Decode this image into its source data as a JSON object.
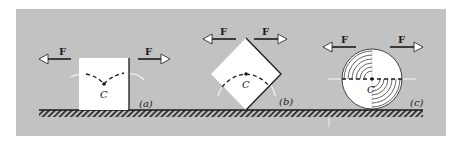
{
  "diagram": {
    "colors": {
      "panel": "#c2c2c2",
      "body": "#ffffff",
      "ink": "#1a1a1a",
      "faint_path": "#f2f2f2"
    },
    "panels": [
      {
        "id": "a",
        "label": "(a)",
        "shape": "square",
        "center_label": "C",
        "force_left_label": "F",
        "force_right_label": "F"
      },
      {
        "id": "b",
        "label": "(b)",
        "shape": "square on edge (rotated 45°)",
        "center_label": "C",
        "force_left_label": "F",
        "force_right_label": "F"
      },
      {
        "id": "c",
        "label": "(c)",
        "shape": "disk",
        "center_label": "C",
        "force_left_label": "F",
        "force_right_label": "F"
      }
    ]
  }
}
